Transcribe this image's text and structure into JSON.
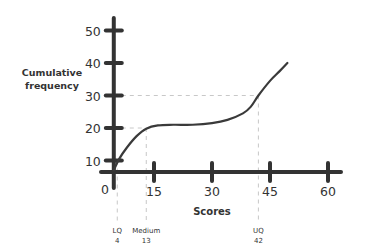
{
  "chart_data": {
    "type": "line",
    "title": "",
    "xlabel": "Scores",
    "ylabel": "Cumulative frequency",
    "ylabel_lines": [
      "Cumulative",
      "frequency"
    ],
    "xlim": [
      0,
      63
    ],
    "ylim": [
      0,
      52
    ],
    "x_axis_origin": 4.6,
    "y_axis_cross": 6.5,
    "xticks": [
      15,
      30,
      45,
      60
    ],
    "xtick_labels": [
      "15",
      "30",
      "45",
      "60"
    ],
    "yticks": [
      10,
      20,
      30,
      40,
      50
    ],
    "ytick_labels": [
      "10",
      "20",
      "30",
      "40",
      "50"
    ],
    "origin_label": "0",
    "grid": false,
    "series": [
      {
        "name": "Cumulative frequency curve",
        "x": [
          4.6,
          6,
          8,
          10.5,
          13,
          16,
          20,
          25,
          30,
          34,
          38,
          40,
          42,
          45,
          47.5,
          49.5
        ],
        "y": [
          7,
          10.5,
          14,
          17.5,
          19.8,
          20.8,
          21,
          21,
          21.5,
          22.5,
          24.5,
          26.5,
          30,
          34.5,
          37.5,
          40
        ]
      }
    ],
    "annotations": [
      {
        "label": "LQ",
        "value": "4",
        "x": 5.5,
        "y": 10
      },
      {
        "label": "Medium",
        "value": "13",
        "x": 13,
        "y": 20
      },
      {
        "label": "UQ",
        "value": "42",
        "x": 42,
        "y": 30
      }
    ]
  }
}
